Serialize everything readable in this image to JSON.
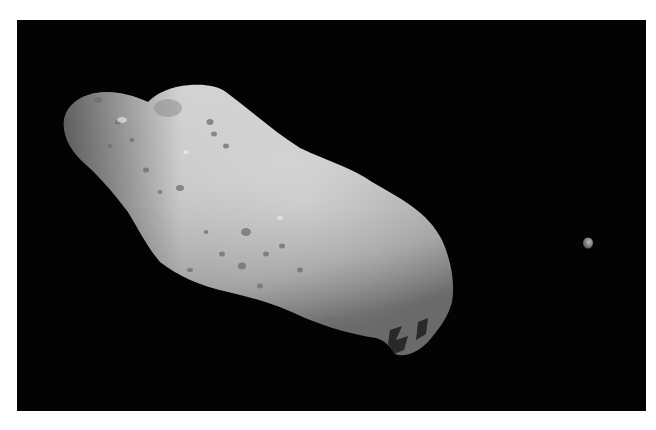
{
  "image": {
    "subject": "Asteroid with small moon against black space",
    "background_color": "#030303",
    "page_color": "#ffffff",
    "asteroid_color": "#bdbdbd",
    "moon_color": "#9a9a9a",
    "objects": [
      {
        "name": "asteroid",
        "description": "Elongated cratered asteroid"
      },
      {
        "name": "moon",
        "description": "Small moonlet to the right"
      }
    ]
  }
}
